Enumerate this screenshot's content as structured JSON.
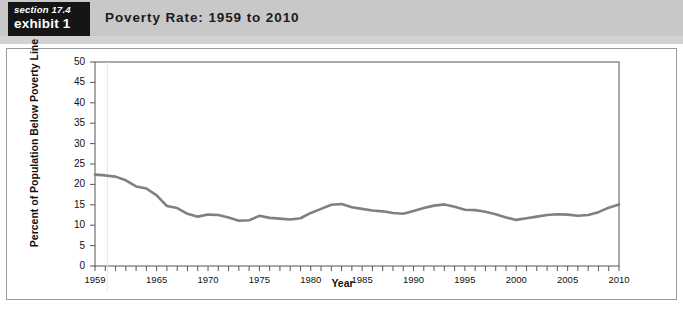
{
  "header": {
    "section_label": "section 17.4",
    "exhibit_label": "exhibit 1",
    "title": "Poverty Rate: 1959 to 2010"
  },
  "colors": {
    "header_band": "#c8c8c8",
    "tag_background": "#151515",
    "tag_text": "#ffffff",
    "line": "#808080",
    "axis": "#555555",
    "panel_border": "#9a9a9a",
    "plot_background": "#ffffff"
  },
  "chart_data": {
    "type": "line",
    "title": "Poverty Rate: 1959 to 2010",
    "xlabel": "Year",
    "ylabel": "Percent of Population Below Poverty Line",
    "series_annotation": "Poverty Rate",
    "legend_position": "inline-annotation",
    "grid": false,
    "xlim": [
      1959,
      2010
    ],
    "ylim": [
      0,
      50
    ],
    "ytick_step": 5,
    "yticks": [
      0,
      5,
      10,
      15,
      20,
      25,
      30,
      35,
      40,
      45,
      50
    ],
    "xticks_labeled": [
      1959,
      1965,
      1970,
      1975,
      1980,
      1985,
      1990,
      1995,
      2000,
      2005,
      2010
    ],
    "xtick_minor_step": 1,
    "x": [
      1959,
      1960,
      1961,
      1962,
      1963,
      1964,
      1965,
      1966,
      1967,
      1968,
      1969,
      1970,
      1971,
      1972,
      1973,
      1974,
      1975,
      1976,
      1977,
      1978,
      1979,
      1980,
      1981,
      1982,
      1983,
      1984,
      1985,
      1986,
      1987,
      1988,
      1989,
      1990,
      1991,
      1992,
      1993,
      1994,
      1995,
      1996,
      1997,
      1998,
      1999,
      2000,
      2001,
      2002,
      2003,
      2004,
      2005,
      2006,
      2007,
      2008,
      2009,
      2010
    ],
    "values": [
      22.4,
      22.2,
      21.9,
      21.0,
      19.5,
      19.0,
      17.3,
      14.7,
      14.2,
      12.8,
      12.1,
      12.6,
      12.5,
      11.9,
      11.1,
      11.2,
      12.3,
      11.8,
      11.6,
      11.4,
      11.7,
      13.0,
      14.0,
      15.0,
      15.2,
      14.4,
      14.0,
      13.6,
      13.4,
      13.0,
      12.8,
      13.5,
      14.2,
      14.8,
      15.1,
      14.5,
      13.8,
      13.7,
      13.3,
      12.7,
      11.9,
      11.3,
      11.7,
      12.1,
      12.5,
      12.7,
      12.6,
      12.3,
      12.5,
      13.2,
      14.3,
      15.1
    ]
  }
}
